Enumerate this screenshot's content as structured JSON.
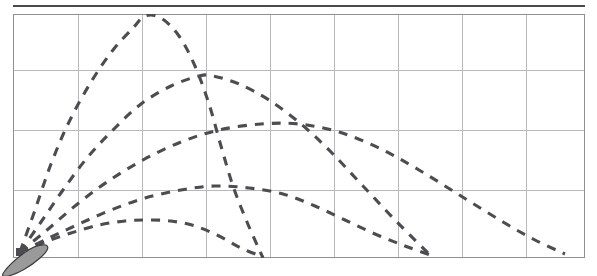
{
  "app": {
    "title": "Projectile Trajectory Simulation",
    "top_rule_color": "#4a4a4a",
    "background_color": "#ffffff"
  },
  "plot": {
    "frame_color": "#8f8f93",
    "grid_color": "#b9b9bb",
    "trajectory_color": "#4c4c52",
    "launcher_color": "#9a9a9a",
    "launcher_label": "cannon",
    "origin_marker_label": "muzzle-point"
  },
  "chart_data": {
    "type": "line",
    "title": "",
    "xlabel": "",
    "ylabel": "",
    "grid": true,
    "legend_position": "none",
    "xlim": [
      0,
      572
    ],
    "ylim": [
      0,
      244
    ],
    "x_gridlines": [
      65,
      129,
      193,
      257,
      321,
      385,
      449,
      513
    ],
    "y_gridlines": [
      56,
      116,
      176
    ],
    "launcher": {
      "x": 7,
      "y": 238,
      "angle_deg": 35
    },
    "series": [
      {
        "name": "trajectory-1-steep",
        "launch_angle_deg": 80,
        "apex": {
          "x": 132,
          "y": 2
        },
        "landing": {
          "x": 250,
          "y": 244
        },
        "points": [
          [
            7,
            238
          ],
          [
            22,
            196
          ],
          [
            38,
            150
          ],
          [
            56,
            108
          ],
          [
            78,
            68
          ],
          [
            100,
            36
          ],
          [
            120,
            14
          ],
          [
            132,
            2
          ],
          [
            148,
            4
          ],
          [
            166,
            22
          ],
          [
            182,
            52
          ],
          [
            196,
            90
          ],
          [
            208,
            132
          ],
          [
            220,
            172
          ],
          [
            234,
            208
          ],
          [
            250,
            244
          ]
        ]
      },
      {
        "name": "trajectory-2-high",
        "launch_angle_deg": 66,
        "apex": {
          "x": 196,
          "y": 62
        },
        "landing": {
          "x": 420,
          "y": 244
        },
        "points": [
          [
            7,
            238
          ],
          [
            28,
            208
          ],
          [
            50,
            176
          ],
          [
            74,
            144
          ],
          [
            100,
            116
          ],
          [
            128,
            90
          ],
          [
            158,
            72
          ],
          [
            186,
            62
          ],
          [
            200,
            62
          ],
          [
            226,
            70
          ],
          [
            256,
            86
          ],
          [
            288,
            110
          ],
          [
            318,
            138
          ],
          [
            350,
            172
          ],
          [
            384,
            208
          ],
          [
            420,
            244
          ]
        ]
      },
      {
        "name": "trajectory-3-mid",
        "launch_angle_deg": 52,
        "apex": {
          "x": 256,
          "y": 110
        },
        "landing": {
          "x": 552,
          "y": 240
        },
        "points": [
          [
            7,
            238
          ],
          [
            34,
            216
          ],
          [
            62,
            192
          ],
          [
            94,
            168
          ],
          [
            130,
            146
          ],
          [
            168,
            128
          ],
          [
            206,
            116
          ],
          [
            248,
            110
          ],
          [
            286,
            110
          ],
          [
            326,
            118
          ],
          [
            366,
            134
          ],
          [
            406,
            156
          ],
          [
            448,
            182
          ],
          [
            490,
            208
          ],
          [
            522,
            226
          ],
          [
            552,
            240
          ]
        ]
      },
      {
        "name": "trajectory-4-low",
        "launch_angle_deg": 36,
        "apex": {
          "x": 202,
          "y": 172
        },
        "landing": {
          "x": 420,
          "y": 242
        },
        "points": [
          [
            7,
            238
          ],
          [
            36,
            224
          ],
          [
            66,
            210
          ],
          [
            98,
            196
          ],
          [
            132,
            184
          ],
          [
            168,
            176
          ],
          [
            202,
            172
          ],
          [
            236,
            174
          ],
          [
            270,
            180
          ],
          [
            302,
            192
          ],
          [
            332,
            206
          ],
          [
            362,
            220
          ],
          [
            392,
            232
          ],
          [
            420,
            242
          ]
        ]
      },
      {
        "name": "trajectory-5-flat",
        "launch_angle_deg": 22,
        "apex": {
          "x": 134,
          "y": 206
        },
        "landing": {
          "x": 250,
          "y": 243
        },
        "points": [
          [
            7,
            238
          ],
          [
            32,
            228
          ],
          [
            58,
            219
          ],
          [
            86,
            211
          ],
          [
            112,
            207
          ],
          [
            134,
            206
          ],
          [
            158,
            207
          ],
          [
            182,
            212
          ],
          [
            206,
            222
          ],
          [
            228,
            234
          ],
          [
            250,
            243
          ]
        ]
      }
    ]
  }
}
